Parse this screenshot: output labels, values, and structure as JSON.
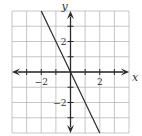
{
  "chart_data": {
    "type": "line",
    "title": "",
    "xlabel": "x",
    "ylabel": "y",
    "xlim": [
      -4,
      4
    ],
    "ylim": [
      -4,
      4
    ],
    "grid": true,
    "grid_step": 1,
    "x_tick_labels": [
      {
        "value": -2,
        "label": "−2"
      },
      {
        "value": 2,
        "label": "2"
      }
    ],
    "y_tick_labels": [
      {
        "value": 2,
        "label": "2"
      },
      {
        "value": -2,
        "label": "−2"
      }
    ],
    "series": [
      {
        "name": "y = -2x",
        "equation": "y = -2x",
        "points": [
          [
            -2,
            4
          ],
          [
            0,
            0
          ],
          [
            2,
            -4
          ]
        ]
      }
    ],
    "axes_arrows": true
  }
}
